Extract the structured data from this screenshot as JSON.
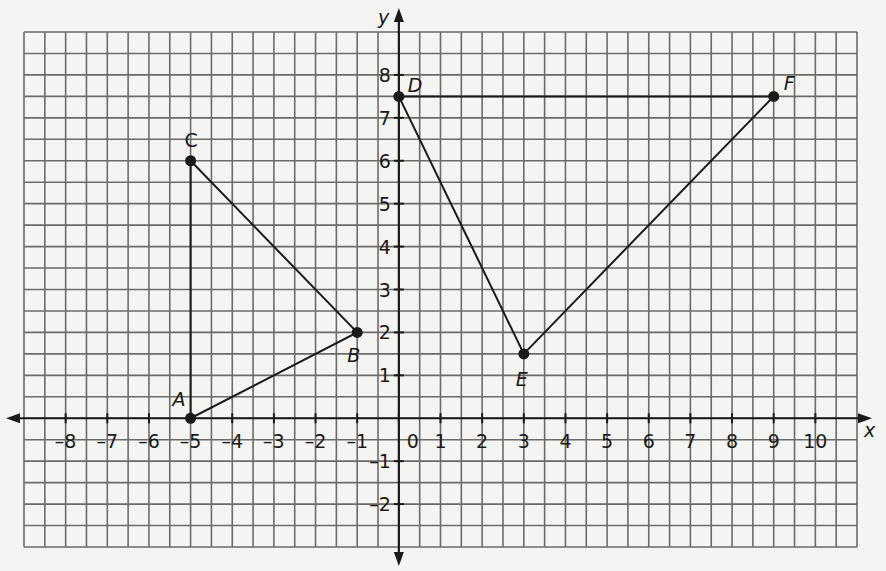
{
  "chart_data": {
    "type": "scatter",
    "title": "",
    "xlabel": "x",
    "ylabel": "y",
    "xlim": [
      -9,
      11
    ],
    "ylim": [
      -3,
      9
    ],
    "grid": true,
    "grid_step": 0.5,
    "x_ticks": [
      -8,
      -7,
      -6,
      -5,
      -4,
      -3,
      -2,
      -1,
      0,
      1,
      2,
      3,
      4,
      5,
      6,
      7,
      8,
      9,
      10
    ],
    "x_tick_labels": [
      "–8",
      "–7",
      "–6",
      "–5",
      "–4",
      "–3",
      "–2",
      "–1",
      "0",
      "1",
      "2",
      "3",
      "4",
      "5",
      "6",
      "7",
      "8",
      "9",
      "10"
    ],
    "y_ticks": [
      -2,
      -1,
      1,
      2,
      3,
      4,
      5,
      6,
      7,
      8
    ],
    "y_tick_labels": [
      "–2",
      "–1",
      "1",
      "2",
      "3",
      "4",
      "5",
      "6",
      "7",
      "8"
    ],
    "points": [
      {
        "label": "A",
        "x": -5,
        "y": 0
      },
      {
        "label": "B",
        "x": -1,
        "y": 2
      },
      {
        "label": "C",
        "x": -5,
        "y": 6
      },
      {
        "label": "D",
        "x": 0,
        "y": 7.5
      },
      {
        "label": "E",
        "x": 3,
        "y": 1.5
      },
      {
        "label": "F",
        "x": 9,
        "y": 7.5
      }
    ],
    "polygons": [
      {
        "name": "triangle ABC",
        "vertices": [
          "A",
          "B",
          "C"
        ]
      },
      {
        "name": "triangle DEF",
        "vertices": [
          "D",
          "E",
          "F"
        ]
      }
    ]
  },
  "colors": {
    "background": "#f4f4f2",
    "grid": "#6b6b6b",
    "ink": "#1a1a1a"
  }
}
